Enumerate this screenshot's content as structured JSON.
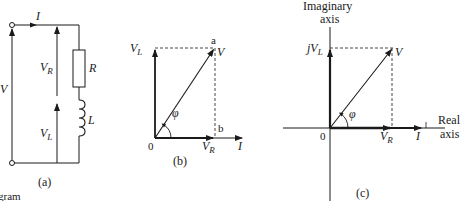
{
  "figure": {
    "panels": [
      {
        "id": "a",
        "caption": "(a)",
        "type": "circuit",
        "labels": {
          "current": "I",
          "source": "V",
          "v_r": "V",
          "v_r_sub": "R",
          "v_l": "V",
          "v_l_sub": "L",
          "resistor": "R",
          "inductor": "L"
        }
      },
      {
        "id": "b",
        "caption": "(b)",
        "type": "phasor",
        "labels": {
          "v_l": "V",
          "v_l_sub": "L",
          "v": "V",
          "v_r": "V",
          "v_r_sub": "R",
          "current": "I",
          "angle": "φ",
          "origin": "0",
          "point_a": "a",
          "point_b": "b"
        }
      },
      {
        "id": "c",
        "caption": "(c)",
        "type": "complex-plane",
        "labels": {
          "imag_axis_1": "Imaginary",
          "imag_axis_2": "axis",
          "real_axis_1": "Real",
          "real_axis_2": "axis",
          "jv_l": "jV",
          "jv_l_sub": "L",
          "v": "V",
          "v_r": "V",
          "v_r_sub": "R",
          "current": "I",
          "angle": "φ",
          "origin": "0"
        }
      }
    ],
    "cut_text": "gram"
  },
  "colors": {
    "ink": "#1a1a1a",
    "background": "#ffffff"
  }
}
